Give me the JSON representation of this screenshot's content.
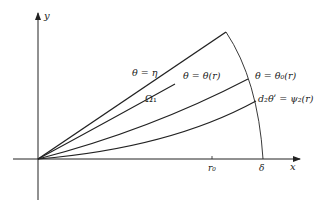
{
  "diagram": {
    "axes": {
      "x_label": "x",
      "y_label": "y",
      "tick_r0": "r₀",
      "tick_delta": "δ"
    },
    "labels": {
      "theta_eta": "θ = η",
      "omega1": "Ω₁",
      "theta_r": "θ = θ(r)",
      "theta_0_r": "θ = θ₀(r)",
      "psi2": "d₂θʹ = ψ₂(r)"
    },
    "colors": {
      "stroke": "#222222",
      "background": "#ffffff"
    }
  }
}
